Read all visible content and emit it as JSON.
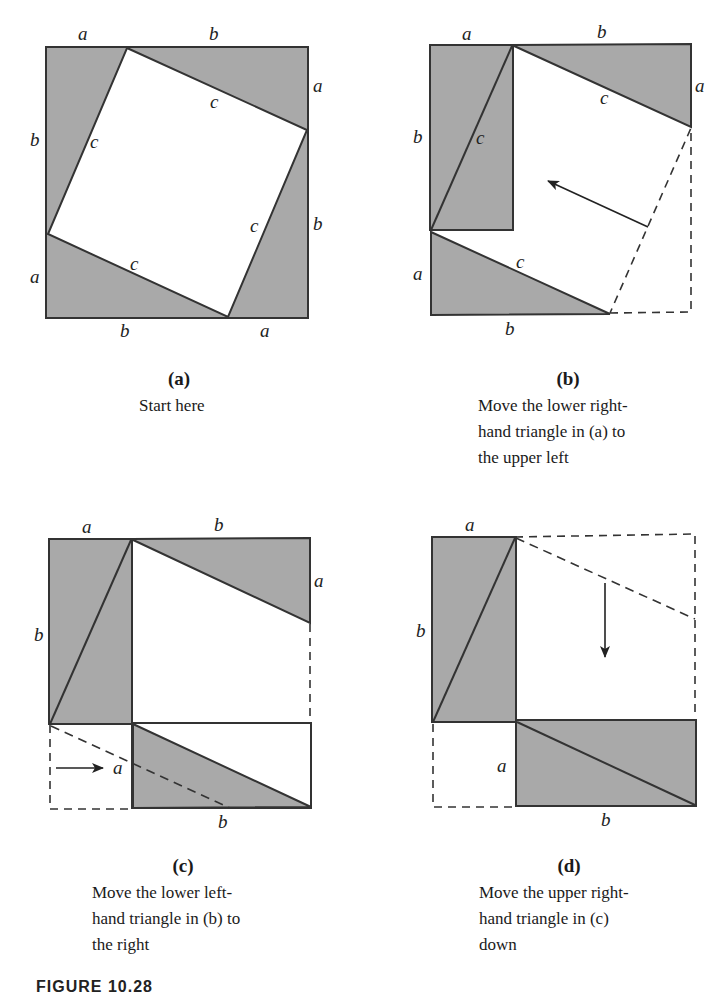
{
  "colors": {
    "shade": "#a9a9a9",
    "stroke": "#333333",
    "background": "#ffffff"
  },
  "panels": [
    {
      "id": "a",
      "label": "(a)",
      "caption": [
        "Start here"
      ],
      "side_labels": {
        "top_a": "a",
        "top_b": "b",
        "right_a": "a",
        "right_b": "b",
        "left_b": "b",
        "left_a": "a",
        "bottom_b": "b",
        "bottom_a": "a",
        "c": "c"
      }
    },
    {
      "id": "b",
      "label": "(b)",
      "caption": [
        "Move the lower right-",
        "hand triangle in (a) to",
        "the upper left"
      ],
      "side_labels": {
        "top_a": "a",
        "top_b": "b",
        "right_a": "a",
        "left_b": "b",
        "left_a": "a",
        "bottom_b": "b",
        "c": "c"
      }
    },
    {
      "id": "c",
      "label": "(c)",
      "caption": [
        "Move the lower left-",
        "hand triangle in (b) to",
        "the right"
      ],
      "side_labels": {
        "top_a": "a",
        "top_b": "b",
        "right_a": "a",
        "left_b": "b",
        "inner_a": "a",
        "bottom_b": "b"
      }
    },
    {
      "id": "d",
      "label": "(d)",
      "caption": [
        "Move the upper right-",
        "hand triangle in (c)",
        "down"
      ],
      "side_labels": {
        "top_a": "a",
        "left_b": "b",
        "inner_a": "a",
        "bottom_b": "b"
      }
    }
  ],
  "figure_label": "FIGURE 10.28"
}
